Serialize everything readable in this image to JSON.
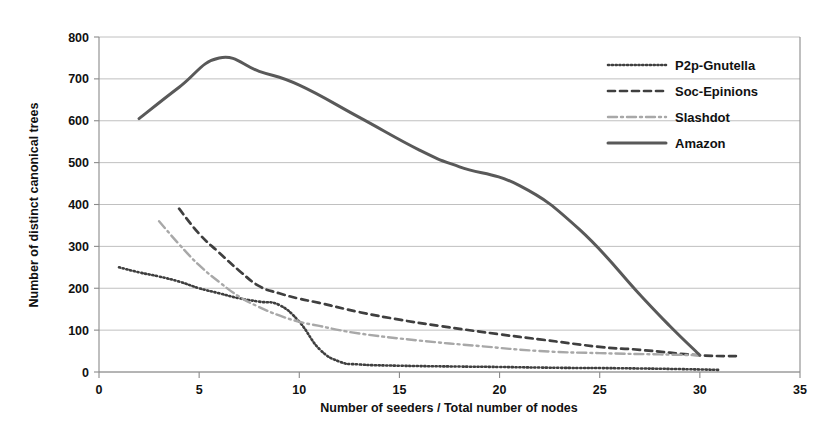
{
  "chart_data": {
    "type": "line",
    "title": "",
    "xlabel": "Number of seeders / Total number of nodes",
    "ylabel": "Number of distinct canonical trees",
    "xlim": [
      0,
      35
    ],
    "ylim": [
      0,
      800
    ],
    "xticks": [
      0,
      5,
      10,
      15,
      20,
      25,
      30,
      35
    ],
    "yticks": [
      0,
      100,
      200,
      300,
      400,
      500,
      600,
      700,
      800
    ],
    "grid": "horizontal",
    "legend_position": "top-right",
    "series": [
      {
        "name": "P2p-Gnutella",
        "style": "dotted",
        "color": "#3f3f3f",
        "dasharray": "1.2,2.6",
        "width": 2.6,
        "points": [
          [
            1,
            250
          ],
          [
            2,
            238
          ],
          [
            3,
            228
          ],
          [
            4,
            216
          ],
          [
            5,
            200
          ],
          [
            6,
            188
          ],
          [
            7,
            176
          ],
          [
            8,
            168
          ],
          [
            9,
            160
          ],
          [
            10,
            120
          ],
          [
            11,
            55
          ],
          [
            12,
            25
          ],
          [
            13,
            18
          ],
          [
            15,
            15
          ],
          [
            18,
            13
          ],
          [
            20,
            12
          ],
          [
            23,
            10
          ],
          [
            26,
            9
          ],
          [
            29,
            7
          ],
          [
            31,
            5
          ]
        ]
      },
      {
        "name": "Soc-Epinions",
        "style": "dashed",
        "color": "#3f3f3f",
        "dasharray": "7,5",
        "width": 2.7,
        "points": [
          [
            4,
            390
          ],
          [
            5,
            330
          ],
          [
            6,
            285
          ],
          [
            7,
            242
          ],
          [
            8,
            205
          ],
          [
            9,
            188
          ],
          [
            10,
            175
          ],
          [
            11,
            165
          ],
          [
            13,
            143
          ],
          [
            15,
            125
          ],
          [
            17,
            110
          ],
          [
            20,
            90
          ],
          [
            22,
            78
          ],
          [
            25,
            60
          ],
          [
            27,
            53
          ],
          [
            30,
            40
          ],
          [
            32,
            38
          ]
        ]
      },
      {
        "name": "Slashdot",
        "style": "dash-dot",
        "color": "#a8a8a8",
        "dasharray": "9,4,2,4",
        "width": 2.4,
        "points": [
          [
            3,
            360
          ],
          [
            4,
            305
          ],
          [
            5,
            255
          ],
          [
            6,
            215
          ],
          [
            7,
            180
          ],
          [
            8,
            155
          ],
          [
            9,
            135
          ],
          [
            10,
            120
          ],
          [
            11,
            110
          ],
          [
            13,
            92
          ],
          [
            16,
            75
          ],
          [
            19,
            62
          ],
          [
            22,
            50
          ],
          [
            25,
            45
          ],
          [
            28,
            42
          ],
          [
            30,
            40
          ]
        ]
      },
      {
        "name": "Amazon",
        "style": "solid",
        "color": "#595959",
        "dasharray": "",
        "width": 3.0,
        "points": [
          [
            2,
            605
          ],
          [
            4,
            680
          ],
          [
            6,
            750
          ],
          [
            8,
            718
          ],
          [
            10,
            685
          ],
          [
            13,
            608
          ],
          [
            16,
            530
          ],
          [
            18,
            490
          ],
          [
            21,
            445
          ],
          [
            24,
            340
          ],
          [
            27,
            185
          ],
          [
            28.5,
            110
          ],
          [
            30,
            40
          ]
        ]
      }
    ]
  },
  "axes": {
    "x_tick_labels": [
      "0",
      "5",
      "10",
      "15",
      "20",
      "25",
      "30",
      "35"
    ],
    "y_tick_labels": [
      "0",
      "100",
      "200",
      "300",
      "400",
      "500",
      "600",
      "700",
      "800"
    ],
    "x_axis_title": "Number of seeders / Total number of nodes",
    "y_axis_title": "Number of distinct canonical trees"
  },
  "legend": {
    "entries": [
      {
        "label": "P2p-Gnutella"
      },
      {
        "label": "Soc-Epinions"
      },
      {
        "label": "Slashdot"
      },
      {
        "label": "Amazon"
      }
    ]
  }
}
